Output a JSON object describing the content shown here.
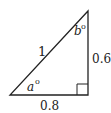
{
  "diagram": {
    "type": "right-triangle",
    "hypotenuse_label": "1",
    "base_label": "0.8",
    "height_label": "0.6",
    "angle_a_label": "a",
    "angle_b_label": "b",
    "degree_symbol": "o",
    "right_angle_marker": true,
    "stroke_color": "#222222"
  }
}
